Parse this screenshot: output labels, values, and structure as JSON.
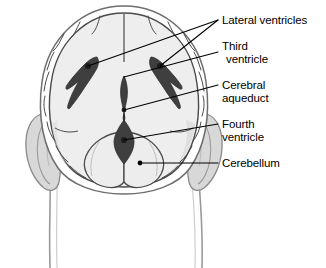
{
  "figure": {
    "kind": "anatomical-diagram",
    "background_color": "#ffffff"
  },
  "colors": {
    "outline": "#3a3a3a",
    "skull_outline": "#707070",
    "brain_fill": "#eeeeee",
    "brain_fill_shadow": "#dcdcdc",
    "ear_fill": "#d8d8d8",
    "ear_outline": "#8a8a8a",
    "ventricle_fill": "#3f3f3f",
    "ventricle_dark": "#2e2e2e",
    "leader_line": "#000000",
    "text": "#000000",
    "neck_line": "#8a8a8a"
  },
  "labels": [
    {
      "id": "lateral-ventricles",
      "line1": "Lateral ventricles",
      "line2": "",
      "anchor_x": 218,
      "anchor_y": 20
    },
    {
      "id": "third-ventricle",
      "line1": "Third",
      "line2": "ventricle",
      "anchor_x": 218,
      "anchor_y": 52
    },
    {
      "id": "cerebral-aqueduct",
      "line1": "Cerebral",
      "line2": "aqueduct",
      "anchor_x": 218,
      "anchor_y": 85
    },
    {
      "id": "fourth-ventricle",
      "line1": "Fourth",
      "line2": "ventricle",
      "anchor_x": 218,
      "anchor_y": 124
    },
    {
      "id": "cerebellum",
      "line1": "Cerebellum",
      "line2": "",
      "anchor_x": 218,
      "anchor_y": 163
    }
  ],
  "structures": [
    {
      "id": "skull",
      "name": "Skull outline"
    },
    {
      "id": "brain",
      "name": "Cerebrum"
    },
    {
      "id": "ear-left",
      "name": "Left ear"
    },
    {
      "id": "ear-right",
      "name": "Right ear"
    },
    {
      "id": "lateral-ventricle-left",
      "name": "Left lateral ventricle"
    },
    {
      "id": "lateral-ventricle-right",
      "name": "Right lateral ventricle"
    },
    {
      "id": "third-ventricle",
      "name": "Third ventricle"
    },
    {
      "id": "cerebral-aqueduct",
      "name": "Cerebral aqueduct"
    },
    {
      "id": "fourth-ventricle",
      "name": "Fourth ventricle"
    },
    {
      "id": "cerebellum",
      "name": "Cerebellum"
    }
  ]
}
